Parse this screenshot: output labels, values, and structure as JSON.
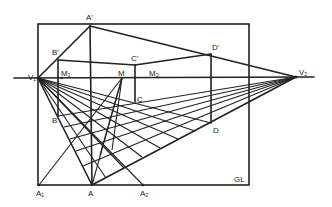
{
  "diagram": {
    "type": "two-point perspective construction",
    "colors": {
      "line": "#222222",
      "background": "#ffffff"
    },
    "points": {
      "A_prime": {
        "label": "A'",
        "x": 90,
        "y": 26
      },
      "B_prime": {
        "label": "B'",
        "x": 58,
        "y": 60
      },
      "C_prime": {
        "label": "C'",
        "x": 135,
        "y": 65
      },
      "D_prime": {
        "label": "D'",
        "x": 211,
        "y": 54
      },
      "V1": {
        "label": "V₁",
        "x": 38,
        "y": 78
      },
      "V2": {
        "label": "V₂",
        "x": 296,
        "y": 77
      },
      "M1": {
        "label": "M₁",
        "x": 62,
        "y": 78
      },
      "M": {
        "label": "M",
        "x": 122,
        "y": 78
      },
      "M2": {
        "label": "M₂",
        "x": 150,
        "y": 78
      },
      "B": {
        "label": "B",
        "x": 58,
        "y": 116
      },
      "C": {
        "label": "C",
        "x": 135,
        "y": 102
      },
      "D": {
        "label": "D",
        "x": 211,
        "y": 123
      },
      "A": {
        "label": "A",
        "x": 92,
        "y": 185
      },
      "A1": {
        "label": "A₁",
        "x": 39,
        "y": 185
      },
      "A2": {
        "label": "A₂",
        "x": 143,
        "y": 185
      }
    },
    "labels": {
      "a_prime": "A'",
      "b_prime": "B'",
      "c_prime": "C'",
      "d_prime": "D'",
      "v1": "V₁",
      "v2": "V₂",
      "m1": "M₁",
      "m": "M",
      "m2": "M₂",
      "b": "B",
      "c": "C",
      "d": "D",
      "a": "A",
      "a1": "A₁",
      "a2": "A₂",
      "gl": "GL"
    }
  }
}
